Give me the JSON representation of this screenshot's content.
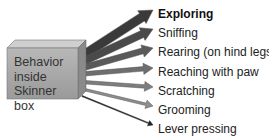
{
  "diagram": {
    "title": "Behavior inside Skinner box",
    "source": {
      "label_lines": [
        "Behavior",
        "inside",
        "Skinner box"
      ],
      "front_color": "#a9a9a9",
      "top_color": "#cfcfcf",
      "side_color": "#8a8a8a"
    },
    "behaviors": [
      {
        "label": "Exploring",
        "bold": true,
        "y": 14,
        "stroke": 9,
        "color": "#3a3a3a",
        "head": 11
      },
      {
        "label": "Sniffing",
        "bold": false,
        "y": 33,
        "stroke": 7.5,
        "color": "#4a4a4a",
        "head": 10
      },
      {
        "label": "Rearing (on hind legs)",
        "bold": false,
        "y": 52,
        "stroke": 6,
        "color": "#5a5a5a",
        "head": 9
      },
      {
        "label": "Reaching with paw",
        "bold": false,
        "y": 72,
        "stroke": 4.5,
        "color": "#6e6e6e",
        "head": 8
      },
      {
        "label": "Scratching",
        "bold": false,
        "y": 91,
        "stroke": 3.5,
        "color": "#7e7e7e",
        "head": 7
      },
      {
        "label": "Grooming",
        "bold": false,
        "y": 110,
        "stroke": 2.5,
        "color": "#8e8e8e",
        "head": 6
      },
      {
        "label": "Lever pressing",
        "bold": false,
        "y": 129,
        "stroke": 1,
        "color": "#222222",
        "head": 4
      }
    ]
  }
}
